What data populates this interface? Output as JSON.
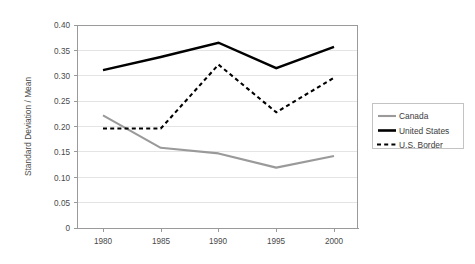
{
  "chart_data": {
    "type": "line",
    "title": "",
    "xlabel": "",
    "ylabel": "Standard Deviation / Mean",
    "x": [
      1980,
      1985,
      1990,
      1995,
      2000
    ],
    "categories": [
      "1980",
      "1985",
      "1990",
      "1995",
      "2000"
    ],
    "xlim": [
      1978.5,
      2001.5
    ],
    "ylim": [
      0,
      0.4
    ],
    "ytick_labels": [
      "0.40",
      "0.35",
      "0.30",
      "0.25",
      "0.20",
      "0.15",
      "0.10",
      "0.05",
      "0"
    ],
    "ytick_values": [
      0.4,
      0.35,
      0.3,
      0.25,
      0.2,
      0.15,
      0.1,
      0.05,
      0
    ],
    "grid": true,
    "grid_axis": "y",
    "legend_position": "right",
    "series": [
      {
        "name": "Canada",
        "values": [
          0.222,
          0.158,
          0.147,
          0.119,
          0.142
        ],
        "color": "#9a9a9a",
        "style": "solid"
      },
      {
        "name": "United States",
        "values": [
          0.311,
          0.337,
          0.365,
          0.315,
          0.357
        ],
        "color": "#000000",
        "style": "solid-bold"
      },
      {
        "name": "U.S. Border",
        "values": [
          0.196,
          0.196,
          0.322,
          0.228,
          0.296
        ],
        "color": "#000000",
        "style": "dashed"
      }
    ]
  },
  "axes": {
    "y_title": "Standard Deviation / Mean",
    "y_labels": {
      "t0": "0.40",
      "t1": "0.35",
      "t2": "0.30",
      "t3": "0.25",
      "t4": "0.20",
      "t5": "0.15",
      "t6": "0.10",
      "t7": "0.05",
      "t8": "0"
    },
    "x_labels": {
      "t0": "1980",
      "t1": "1985",
      "t2": "1990",
      "t3": "1995",
      "t4": "2000"
    }
  },
  "legend": {
    "items": {
      "i0": "Canada",
      "i1": "United States",
      "i2": "U.S. Border"
    }
  },
  "colors": {
    "canada": "#9a9a9a",
    "united_states": "#000000",
    "us_border": "#000000",
    "grid": "#d9d9d9",
    "frame": "#9a9a9a",
    "background": "#ffffff"
  }
}
